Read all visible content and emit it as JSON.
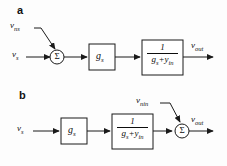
{
  "figure": {
    "background_color": "#fdfdfd",
    "line_color": "#1a1a1a",
    "text_color": "#0d0d0d"
  },
  "panels": [
    {
      "id": "a",
      "label": "a",
      "description": "Noise source at input summing junction",
      "nodes": {
        "input_signal": {
          "base": "v",
          "sub": "s",
          "full": "v_s"
        },
        "noise_source": {
          "base": "v",
          "sub": "ns",
          "full": "v_ns"
        },
        "output_signal": {
          "base": "v",
          "sub": "out",
          "full": "v_out"
        },
        "summing_junction": {
          "symbol": "Σ",
          "name": "sigma"
        },
        "gain_block": {
          "base": "g",
          "sub": "s",
          "full": "g_s"
        },
        "transfer_block": {
          "numerator": "1",
          "denominator_terms": [
            "g",
            "s",
            "+",
            "y",
            "in"
          ],
          "denominator": "g_s + y_in",
          "full": "1 / (g_s + y_in)"
        }
      }
    },
    {
      "id": "b",
      "label": "b",
      "description": "Noise source at output summing junction",
      "nodes": {
        "input_signal": {
          "base": "v",
          "sub": "s",
          "full": "v_s"
        },
        "noise_source": {
          "base": "v",
          "sub": "nin",
          "full": "v_nin"
        },
        "output_signal": {
          "base": "v",
          "sub": "out",
          "full": "v_out"
        },
        "summing_junction": {
          "symbol": "Σ",
          "name": "sigma"
        },
        "gain_block": {
          "base": "g",
          "sub": "s",
          "full": "g_s"
        },
        "transfer_block": {
          "numerator": "1",
          "denominator_terms": [
            "g",
            "s",
            "+",
            "y",
            "in"
          ],
          "denominator": "g_s + y_in",
          "full": "1 / (g_s + y_in)"
        }
      }
    }
  ]
}
